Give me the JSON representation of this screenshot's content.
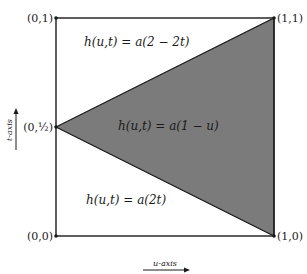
{
  "diagram": {
    "type": "homotopy-domain-square",
    "corners": {
      "top_left": "(0,1)",
      "top_right": "(1,1)",
      "bottom_left": "(0,0)",
      "bottom_right": "(1,0)",
      "left_mid": "(0,½)"
    },
    "regions": {
      "upper": "h(u,t) = a(2 − 2t)",
      "middle": "h(u,t) = a(1 − u)",
      "lower": "h(u,t) = a(2t)"
    },
    "axes": {
      "vertical": "t-axis",
      "horizontal": "u-axis"
    },
    "colors": {
      "fill": "#7b7b7b",
      "stroke": "#1a1a1a",
      "background": "#ffffff"
    }
  }
}
